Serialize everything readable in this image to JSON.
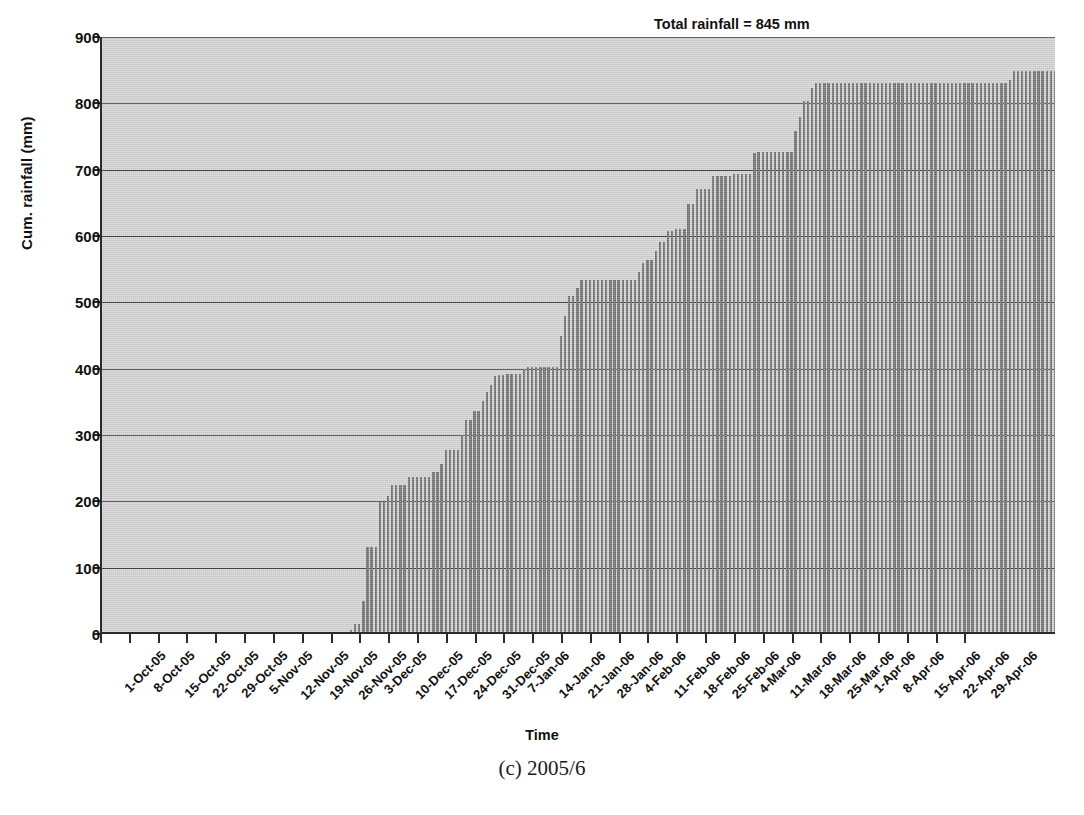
{
  "chart_data": {
    "type": "bar",
    "title": "",
    "caption": "(c) 2005/6",
    "xlabel": "Time",
    "ylabel": "Cum. rainfall (mm)",
    "ylim": [
      0,
      900
    ],
    "ytick_values": [
      0,
      100,
      200,
      300,
      400,
      500,
      600,
      700,
      800,
      900
    ],
    "ytick_labels": [
      "0",
      "100",
      "200",
      "300",
      "400",
      "500",
      "600",
      "700",
      "800",
      "900"
    ],
    "grid": "horizontal",
    "legend": "none",
    "annotations": [
      {
        "text": "Total rainfall = 845 mm",
        "x": "2006-03-01",
        "y": 870
      }
    ],
    "xlabel_rotation_deg": 45,
    "x_start": "1-Oct-05",
    "x_end": "29-Apr-06",
    "x_tick_interval_days": 7,
    "n_days": 211,
    "xtick_labels": [
      "1-Oct-05",
      "8-Oct-05",
      "15-Oct-05",
      "22-Oct-05",
      "29-Oct-05",
      "5-Nov-05",
      "12-Nov-05",
      "19-Nov-05",
      "26-Nov-05",
      "3-Dec-05",
      "10-Dec-05",
      "17-Dec-05",
      "24-Dec-05",
      "31-Dec-05",
      "7-Jan-06",
      "14-Jan-06",
      "21-Jan-06",
      "28-Jan-06",
      "4-Feb-06",
      "11-Feb-06",
      "18-Feb-06",
      "25-Feb-06",
      "4-Mar-06",
      "11-Mar-06",
      "18-Mar-06",
      "25-Mar-06",
      "1-Apr-06",
      "8-Apr-06",
      "15-Apr-06",
      "22-Apr-06",
      "29-Apr-06"
    ],
    "series_name": "Cumulative rainfall",
    "bar_color": "#6d6d6d",
    "plot_background": "#d2d2d2",
    "axis_color": "#2a2a2a",
    "values": [
      0,
      0,
      0,
      0,
      0,
      0,
      0,
      0,
      0,
      0,
      0,
      0,
      0,
      0,
      0,
      0,
      0,
      0,
      0,
      0,
      0,
      0,
      0,
      0,
      0,
      0,
      0,
      0,
      0,
      0,
      0,
      0,
      0,
      0,
      0,
      0,
      0,
      0,
      0,
      0,
      0,
      0,
      0,
      0,
      0,
      0,
      0,
      0,
      0,
      0,
      0,
      0,
      0,
      0,
      0,
      0,
      0,
      0,
      0,
      0,
      3,
      12,
      12,
      47,
      128,
      128,
      128,
      196,
      196,
      205,
      222,
      222,
      222,
      222,
      234,
      234,
      234,
      234,
      234,
      234,
      241,
      241,
      254,
      275,
      275,
      275,
      275,
      297,
      319,
      319,
      333,
      333,
      349,
      362,
      372,
      386,
      388,
      388,
      389,
      389,
      389,
      389,
      397,
      399,
      399,
      399,
      399,
      399,
      399,
      399,
      399,
      446,
      476,
      506,
      506,
      519,
      531,
      531,
      531,
      531,
      531,
      531,
      531,
      531,
      531,
      531,
      531,
      531,
      531,
      531,
      543,
      556,
      561,
      561,
      574,
      588,
      588,
      604,
      604,
      607,
      607,
      607,
      646,
      646,
      668,
      668,
      668,
      668,
      687,
      687,
      687,
      687,
      687,
      690,
      690,
      690,
      690,
      690,
      722,
      724,
      724,
      724,
      724,
      724,
      724,
      724,
      724,
      724,
      756,
      777,
      800,
      800,
      820,
      828,
      828,
      828,
      828,
      828,
      828,
      828,
      828,
      828,
      828,
      828,
      828,
      828,
      828,
      828,
      828,
      828,
      828,
      828,
      828,
      828,
      828,
      828,
      828,
      828,
      828,
      828,
      828,
      828,
      828,
      828,
      828,
      828,
      828,
      828,
      828,
      828,
      828,
      828,
      828,
      828,
      828,
      828,
      828,
      828,
      828,
      828,
      832,
      845,
      845,
      845,
      845,
      845,
      845,
      845,
      845,
      845,
      845,
      845
    ]
  },
  "annotation": {
    "total_rainfall": "Total rainfall = 845 mm"
  },
  "axes": {
    "x_title": "Time",
    "y_title": "Cum. rainfall (mm)"
  },
  "figure": {
    "caption": "(c) 2005/6"
  }
}
